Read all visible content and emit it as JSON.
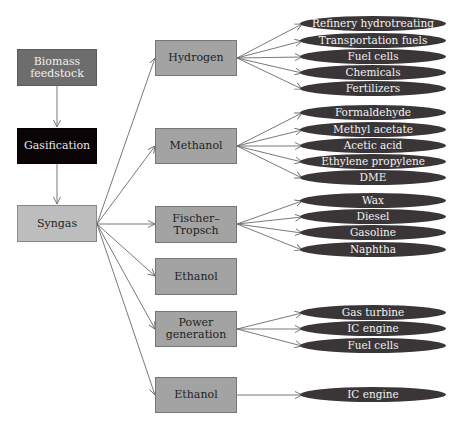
{
  "colors": {
    "line": "#6a6a6a",
    "pill": "#3a3537"
  },
  "sources": {
    "biomass": "Biomass feedstock",
    "biomass_line1": "Biomass",
    "biomass_line2": "feedstock",
    "gasification": "Gasification",
    "syngas": "Syngas"
  },
  "routes": [
    {
      "id": "hydrogen",
      "label": "Hydrogen",
      "products": [
        "Refinery hydrotreating",
        "Transportation fuels",
        "Fuel cells",
        "Chemicals",
        "Fertilizers"
      ]
    },
    {
      "id": "methanol",
      "label": "Methanol",
      "products": [
        "Formaldehyde",
        "Methyl acetate",
        "Acetic acid",
        "Ethylene propylene",
        "DME"
      ]
    },
    {
      "id": "fischer-tropsch",
      "label": "Fischer–",
      "label2": "Tropsch",
      "products": [
        "Wax",
        "Diesel",
        "Gasoline",
        "Naphtha"
      ]
    },
    {
      "id": "ethanol-1",
      "label": "Ethanol",
      "products": []
    },
    {
      "id": "power-generation",
      "label": "Power",
      "label2": "generation",
      "products": [
        "Gas turbine",
        "IC engine",
        "Fuel cells"
      ]
    },
    {
      "id": "ethanol-2",
      "label": "Ethanol",
      "products": [
        "IC engine"
      ]
    }
  ]
}
